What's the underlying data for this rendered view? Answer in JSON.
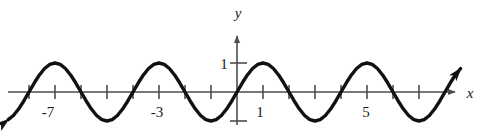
{
  "figure": {
    "background_color": "#ffffff",
    "line_color": "#111111",
    "axis_color": "#4d4d4d",
    "text_color": "#1a1a1a"
  },
  "axes": {
    "x_axis_label": "x",
    "y_axis_label": "y",
    "x_tick_labels": [
      "-7",
      "-3",
      "1",
      "5"
    ],
    "y_tick_labels": [
      "1"
    ],
    "x_labeled_values": [
      -7,
      -3,
      1,
      5
    ],
    "y_labeled_values": [
      1
    ]
  },
  "chart_data": {
    "type": "line",
    "title": "",
    "xlabel": "x",
    "ylabel": "y",
    "xlim": [
      -8.8,
      8.6
    ],
    "ylim": [
      -1.6,
      1.6
    ],
    "grid": false,
    "legend": null,
    "function": "y = sin(pi*x/2)",
    "amplitude": 1,
    "period": 4,
    "phase_shift": 0,
    "vertical_shift": 0,
    "x_tick_step": 1,
    "x_ticks": [
      -8,
      -7,
      -6,
      -5,
      -4,
      -3,
      -2,
      -1,
      0,
      1,
      2,
      3,
      4,
      5,
      6,
      7,
      8
    ],
    "x_labeled_ticks": [
      -7,
      -3,
      1,
      5
    ],
    "y_ticks": [
      -1,
      1
    ],
    "y_labeled_ticks": [
      1
    ],
    "maxima_x": [
      -7,
      -3,
      1,
      5
    ],
    "minima_x": [
      -5,
      -1,
      3,
      7
    ],
    "zeros_x": [
      -8,
      -6,
      -4,
      -2,
      0,
      2,
      4,
      6,
      8
    ],
    "series": [
      {
        "name": "y = sin(pi*x/2)",
        "x": [
          -8.8,
          -8.6,
          -8.4,
          -8.2,
          -8.0,
          -7.8,
          -7.6,
          -7.4,
          -7.2,
          -7.0,
          -6.8,
          -6.6,
          -6.4,
          -6.2,
          -6.0,
          -5.8,
          -5.6,
          -5.4,
          -5.2,
          -5.0,
          -4.8,
          -4.6,
          -4.4,
          -4.2,
          -4.0,
          -3.8,
          -3.6,
          -3.4,
          -3.2,
          -3.0,
          -2.8,
          -2.6,
          -2.4,
          -2.2,
          -2.0,
          -1.8,
          -1.6,
          -1.4,
          -1.2,
          -1.0,
          -0.8,
          -0.6,
          -0.4,
          -0.2,
          0.0,
          0.2,
          0.4,
          0.6,
          0.8,
          1.0,
          1.2,
          1.4,
          1.6,
          1.8,
          2.0,
          2.2,
          2.4,
          2.6,
          2.8,
          3.0,
          3.2,
          3.4,
          3.6,
          3.8,
          4.0,
          4.2,
          4.4,
          4.6,
          4.8,
          5.0,
          5.2,
          5.4,
          5.6,
          5.8,
          6.0,
          6.2,
          6.4,
          6.6,
          6.8,
          7.0,
          7.2,
          7.4,
          7.6,
          7.8,
          8.0,
          8.2,
          8.4,
          8.6
        ],
        "y": [
          -0.951,
          -0.809,
          -0.588,
          -0.309,
          0.0,
          0.309,
          0.588,
          0.809,
          0.951,
          1.0,
          0.951,
          0.809,
          0.588,
          0.309,
          0.0,
          -0.309,
          -0.588,
          -0.809,
          -0.951,
          -1.0,
          -0.951,
          -0.809,
          -0.588,
          -0.309,
          0.0,
          0.309,
          0.588,
          0.809,
          0.951,
          1.0,
          0.951,
          0.809,
          0.588,
          0.309,
          0.0,
          -0.309,
          -0.588,
          -0.809,
          -0.951,
          -1.0,
          -0.951,
          -0.809,
          -0.588,
          -0.309,
          0.0,
          0.309,
          0.588,
          0.809,
          0.951,
          1.0,
          0.951,
          0.809,
          0.588,
          0.309,
          0.0,
          -0.309,
          -0.588,
          -0.809,
          -0.951,
          -1.0,
          -0.951,
          -0.809,
          -0.588,
          -0.309,
          0.0,
          0.309,
          0.588,
          0.809,
          0.951,
          1.0,
          0.951,
          0.809,
          0.588,
          0.309,
          0.0,
          -0.309,
          -0.588,
          -0.809,
          -0.951,
          -1.0,
          -0.951,
          -0.809,
          -0.588,
          -0.309,
          0.0,
          0.309,
          0.588,
          0.809
        ]
      }
    ],
    "curve_arrowheads": [
      "upper-left",
      "lower-right"
    ]
  }
}
